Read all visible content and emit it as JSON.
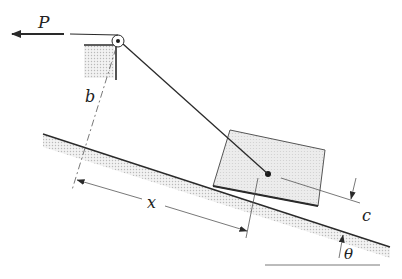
{
  "figure": {
    "type": "mechanics-diagram",
    "labels": {
      "force": "P",
      "pulley_height": "b",
      "distance": "x",
      "offset": "c",
      "angle": "θ"
    },
    "colors": {
      "line": "#2a2a2a",
      "hatch": "#c8c8c8",
      "block_fill": "#e6e6e6",
      "background": "#ffffff"
    }
  }
}
